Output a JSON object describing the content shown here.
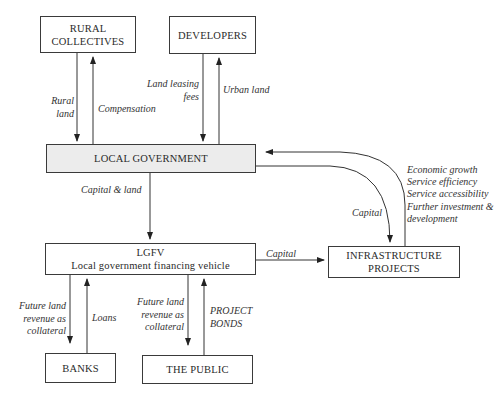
{
  "nodes": {
    "rural_collectives": [
      "RURAL",
      "COLLECTIVES"
    ],
    "developers": "DEVELOPERS",
    "local_government": "LOCAL GOVERNMENT",
    "lgfv": [
      "LGFV",
      "Local government financing vehicle"
    ],
    "infrastructure": [
      "INFRASTRUCTURE",
      "PROJECTS"
    ],
    "banks": "BANKS",
    "public": "THE PUBLIC"
  },
  "edges": {
    "rural_land": [
      "Rural",
      "land"
    ],
    "compensation": "Compensation",
    "land_leasing_fees": [
      "Land leasing",
      "fees"
    ],
    "urban_land": "Urban land",
    "capital_and_land": "Capital  & land",
    "capital_lgfv_infra": "Capital",
    "capital_gov_infra": "Capital",
    "benefits": [
      "Economic growth",
      "Service efficiency",
      "Service accessibility",
      "Further investment &",
      "development"
    ],
    "banks_collateral": [
      "Future land",
      "revenue as",
      "collateral"
    ],
    "loans": "Loans",
    "public_collateral": [
      "Future land",
      "revenue as",
      "collateral"
    ],
    "project_bonds": [
      "PROJECT",
      "BONDS"
    ]
  }
}
